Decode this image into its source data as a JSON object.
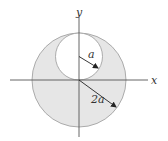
{
  "diagram": {
    "type": "geometry-figure",
    "axes": {
      "x_label": "x",
      "y_label": "y"
    },
    "large_circle": {
      "radius_label": "2a",
      "fill": "#e6e6e6",
      "stroke": "#999999"
    },
    "small_circle": {
      "radius_label": "a",
      "fill": "#ffffff",
      "stroke": "#999999"
    },
    "colors": {
      "axis": "#555555",
      "arrow": "#222222",
      "shaded_region": "#e6e6e6"
    }
  }
}
